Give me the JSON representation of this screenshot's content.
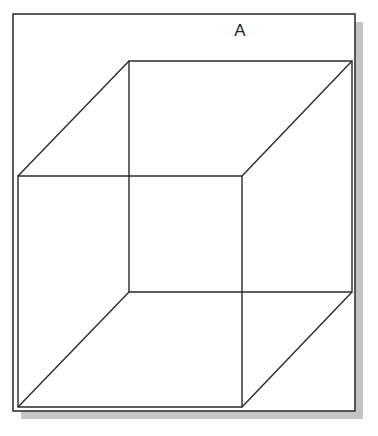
{
  "figure": {
    "label": "A",
    "colors": {
      "background": "#ffffff",
      "frame": "#333333",
      "shadow": "#c4c4c4",
      "lines": "#2a2a2a"
    },
    "frame": {
      "x": 13,
      "y": 14,
      "width": 342,
      "height": 397
    },
    "shadow": {
      "offset_x": 8,
      "offset_y": 8
    },
    "cube": {
      "front_face": {
        "top_left": [
          18,
          176
        ],
        "top_right": [
          242,
          176
        ],
        "bottom_right": [
          242,
          407
        ],
        "bottom_left": [
          18,
          407
        ]
      },
      "back_face": {
        "top_left": [
          129,
          61
        ],
        "top_right": [
          352,
          61
        ],
        "bottom_right": [
          352,
          292
        ],
        "bottom_left": [
          129,
          292
        ]
      }
    }
  }
}
